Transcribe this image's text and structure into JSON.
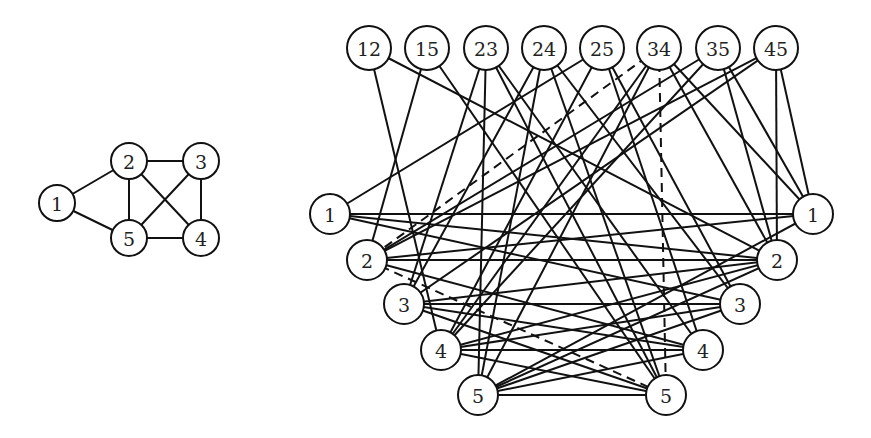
{
  "figure": {
    "small_graph": {
      "radius": 18,
      "font_size": 19,
      "nodes": [
        {
          "id": "1",
          "label": "1",
          "x": 57,
          "y": 203
        },
        {
          "id": "2",
          "label": "2",
          "x": 129,
          "y": 161
        },
        {
          "id": "3",
          "label": "3",
          "x": 201,
          "y": 161
        },
        {
          "id": "4",
          "label": "4",
          "x": 201,
          "y": 238
        },
        {
          "id": "5",
          "label": "5",
          "x": 129,
          "y": 238
        }
      ],
      "edges": [
        [
          "1",
          "2"
        ],
        [
          "1",
          "5"
        ],
        [
          "2",
          "3"
        ],
        [
          "2",
          "5"
        ],
        [
          "2",
          "4"
        ],
        [
          "3",
          "5"
        ],
        [
          "3",
          "4"
        ],
        [
          "5",
          "4"
        ]
      ]
    },
    "large_graph": {
      "edge_node_radius": 22,
      "vertex_node_radius": 20,
      "font_size": 19,
      "top_nodes": [
        {
          "id": "12",
          "label": "12",
          "x": 369,
          "y": 48
        },
        {
          "id": "15",
          "label": "15",
          "x": 427,
          "y": 48
        },
        {
          "id": "23",
          "label": "23",
          "x": 486,
          "y": 48
        },
        {
          "id": "24",
          "label": "24",
          "x": 544,
          "y": 48
        },
        {
          "id": "25",
          "label": "25",
          "x": 602,
          "y": 48
        },
        {
          "id": "34",
          "label": "34",
          "x": 659,
          "y": 48
        },
        {
          "id": "35",
          "label": "35",
          "x": 718,
          "y": 48
        },
        {
          "id": "45",
          "label": "45",
          "x": 776,
          "y": 48
        }
      ],
      "left_nodes": [
        {
          "id": "L1",
          "label": "1",
          "x": 330,
          "y": 214
        },
        {
          "id": "L2",
          "label": "2",
          "x": 367,
          "y": 260
        },
        {
          "id": "L3",
          "label": "3",
          "x": 404,
          "y": 304
        },
        {
          "id": "L4",
          "label": "4",
          "x": 441,
          "y": 350
        },
        {
          "id": "L5",
          "label": "5",
          "x": 478,
          "y": 395
        }
      ],
      "right_nodes": [
        {
          "id": "R1",
          "label": "1",
          "x": 813,
          "y": 214
        },
        {
          "id": "R2",
          "label": "2",
          "x": 777,
          "y": 260
        },
        {
          "id": "R3",
          "label": "3",
          "x": 740,
          "y": 304
        },
        {
          "id": "R4",
          "label": "4",
          "x": 703,
          "y": 350
        },
        {
          "id": "R5",
          "label": "5",
          "x": 666,
          "y": 395
        }
      ],
      "edges": [
        [
          "12",
          "L4"
        ],
        [
          "12",
          "R2"
        ],
        [
          "15",
          "L2"
        ],
        [
          "15",
          "R5"
        ],
        [
          "23",
          "L3"
        ],
        [
          "23",
          "L5"
        ],
        [
          "23",
          "R4"
        ],
        [
          "23",
          "R5"
        ],
        [
          "24",
          "L3"
        ],
        [
          "24",
          "L5"
        ],
        [
          "24",
          "R3"
        ],
        [
          "24",
          "R5"
        ],
        [
          "25",
          "L1"
        ],
        [
          "25",
          "L4"
        ],
        [
          "25",
          "R4"
        ],
        [
          "25",
          "R3"
        ],
        [
          "34",
          "L4"
        ],
        [
          "34",
          "L5"
        ],
        [
          "34",
          "R2"
        ],
        [
          "34",
          "R1"
        ],
        [
          "35",
          "L2"
        ],
        [
          "35",
          "L4"
        ],
        [
          "35",
          "R2"
        ],
        [
          "35",
          "R1"
        ],
        [
          "45",
          "L2"
        ],
        [
          "45",
          "L3"
        ],
        [
          "45",
          "R2"
        ],
        [
          "45",
          "R1"
        ],
        [
          "L1",
          "R1"
        ],
        [
          "L1",
          "R2"
        ],
        [
          "L1",
          "R3"
        ],
        [
          "L2",
          "R1"
        ],
        [
          "L2",
          "R2"
        ],
        [
          "L2",
          "R4"
        ],
        [
          "L3",
          "R2"
        ],
        [
          "L3",
          "R3"
        ],
        [
          "L3",
          "R4"
        ],
        [
          "L3",
          "R5"
        ],
        [
          "L4",
          "R2"
        ],
        [
          "L4",
          "R3"
        ],
        [
          "L4",
          "R4"
        ],
        [
          "L4",
          "R5"
        ],
        [
          "L5",
          "R1"
        ],
        [
          "L5",
          "R2"
        ],
        [
          "L5",
          "R3"
        ],
        [
          "L5",
          "R4"
        ],
        [
          "L5",
          "R5"
        ]
      ],
      "dashed_edges": [
        [
          "34",
          "L2"
        ],
        [
          "34",
          "R5"
        ],
        [
          "L2",
          "R5"
        ]
      ]
    }
  }
}
